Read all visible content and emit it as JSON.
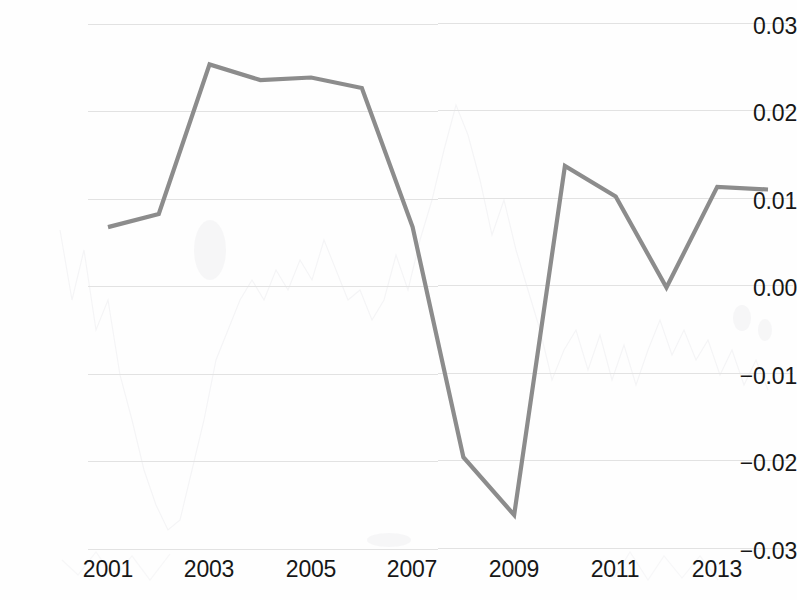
{
  "figure": {
    "kind": "scanned-line-chart",
    "line_color": "#8c8c8c",
    "gridline_color": "#e2e2e2",
    "text_color": "#171717",
    "background_color": "#fefefe"
  },
  "chart_data": {
    "type": "line",
    "title": "",
    "subtitle": "",
    "xlabel": "",
    "ylabel": "",
    "grid": true,
    "legend": false,
    "legend_position": "none",
    "xlim": [
      2001,
      2014
    ],
    "ylim": [
      -0.03,
      0.03
    ],
    "x": [
      2001,
      2002,
      2003,
      2004,
      2005,
      2006,
      2007,
      2008,
      2009,
      2010,
      2011,
      2012,
      2013,
      2014
    ],
    "xtick_labels": [
      "2001",
      "2003",
      "2005",
      "2007",
      "2009",
      "2011",
      "2013"
    ],
    "xticks": [
      2001,
      2003,
      2005,
      2007,
      2009,
      2011,
      2013
    ],
    "ytick_labels": [
      "0.03",
      "0.02",
      "0.01",
      "0.00",
      "−0.01",
      "−0.02",
      "−0.03"
    ],
    "yticks": [
      0.03,
      0.02,
      0.01,
      0.0,
      -0.01,
      -0.02,
      -0.03
    ],
    "series": [
      {
        "name": "series-1",
        "color": "#8c8c8c",
        "values": [
          0.0069,
          0.0084,
          0.0255,
          0.0237,
          0.024,
          0.0228,
          0.0069,
          -0.0194,
          -0.026,
          0.0139,
          0.0104,
          0.0,
          0.0115,
          0.0112
        ]
      }
    ],
    "annotations": []
  }
}
